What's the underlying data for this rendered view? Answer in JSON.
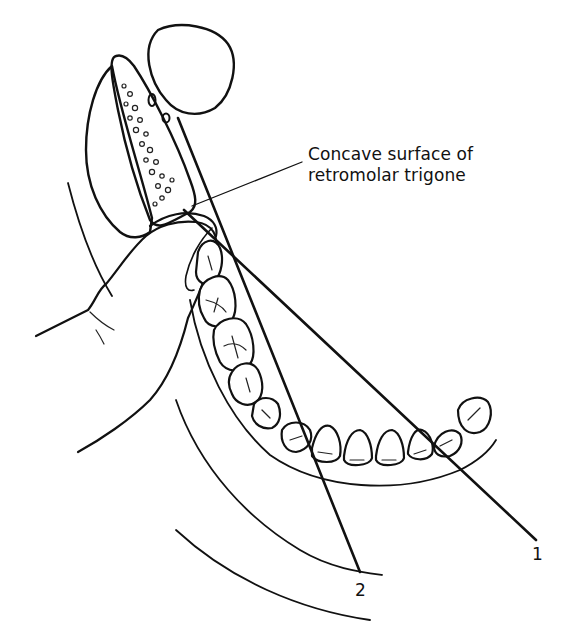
{
  "figure": {
    "colors": {
      "ink": "#111111",
      "background": "#ffffff",
      "hatch": "#222222"
    }
  },
  "labels": {
    "callout_line1": "Concave surface of",
    "callout_line2": "retromolar trigone",
    "line1": "1",
    "line2": "2"
  }
}
